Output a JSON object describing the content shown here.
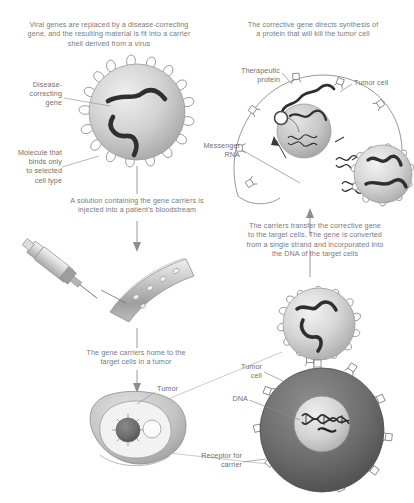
{
  "figure": {
    "title_top_left": "Viral genes are replaced by a disease-correcting\ngene, and the resulting material is fit into a carrier\nshell derived from a virus",
    "title_top_right": "The corrective gene directs synthesis of\na protein that will kill the tumor cell",
    "caption_injection": "A solution containing the gene carriers is\ninjected into a patient's bloodstream",
    "caption_transfer": "The carriers transfer the corrective gene\nto the target cells. The gene is converted\nfrom a single strand and incorporated into\nthe DNA of the target cells",
    "caption_homing": "The gene carriers home to the\ntarget cells in a tumor"
  },
  "labels": {
    "disease_correcting_gene": "Disease-\ncorrecting\ngene",
    "molecule_binds": "Molecule that\nbinds only\nto selected\ncell type",
    "therapeutic_protein": "Therapeutic\nprotein",
    "tumor_cell_top": "Tumor cell",
    "messenger_rna": "Messenger\nRNA",
    "tumor": "Tumor",
    "tumor_cell_bottom": "Tumor\ncell",
    "dna": "DNA",
    "receptor_for_carrier": "Receptor for\ncarrier"
  },
  "colors": {
    "text": "#7a7a7a",
    "stroke": "#8a8a8a",
    "capsid_light": "#d8d8d8",
    "capsid_mid": "#b5b5b5",
    "gene_dark": "#3b3b3b",
    "tumor_cell_dark": "#6f6f6f",
    "nucleus_light": "#c9c9c9",
    "vessel": "#bdbdbd",
    "background": "#ffffff"
  },
  "elements": {
    "virus_particle_top_left": "gene-carrier-virus-particle",
    "virus_particle_mid_right": "gene-carrier-virus-particle",
    "tumor_cell_top_right": "tumor-cell-with-nucleus",
    "target_cell_mid_right": "target-cell-receiving-carrier",
    "syringe": "syringe",
    "blood_vessel": "blood-vessel",
    "tumor_mass": "tumor-mass",
    "tumor_cell_bottom_right": "tumor-cell-with-dna"
  }
}
